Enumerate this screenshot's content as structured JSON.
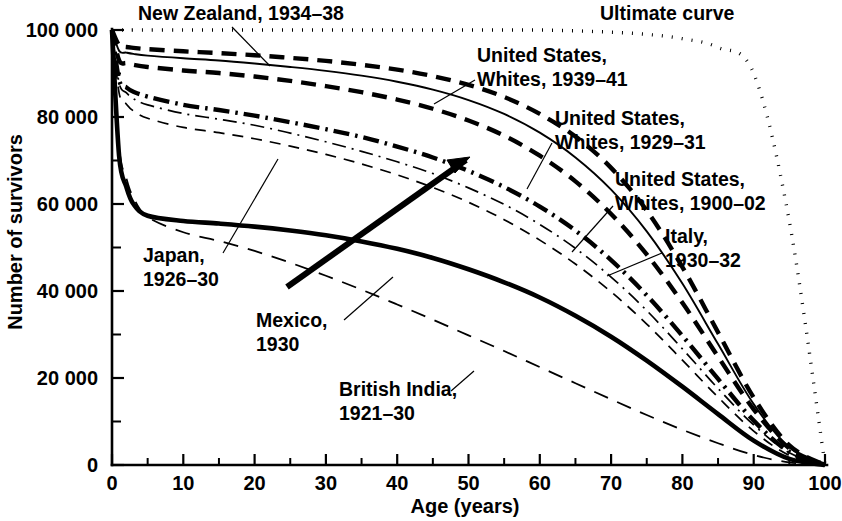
{
  "chart_data": {
    "type": "line",
    "title": "",
    "xlabel": "Age (years)",
    "ylabel": "Number of survivors",
    "xlim": [
      0,
      100
    ],
    "ylim": [
      0,
      100000
    ],
    "grid": false,
    "legend_position": "inline-annotations",
    "x_ticks": [
      0,
      10,
      20,
      30,
      40,
      50,
      60,
      70,
      80,
      90,
      100
    ],
    "x_tick_labels": [
      "0",
      "10",
      "20",
      "30",
      "40",
      "50",
      "60",
      "70",
      "80",
      "90",
      "100"
    ],
    "x_minor_ticks": [
      5,
      15,
      25,
      35,
      45,
      55,
      65,
      75,
      85,
      95
    ],
    "y_ticks": [
      0,
      20000,
      40000,
      60000,
      80000,
      100000
    ],
    "y_tick_labels": [
      "0",
      "20 000",
      "40 000",
      "60 000",
      "80 000",
      "100 000"
    ],
    "y_minor_ticks": [
      10000,
      30000,
      50000,
      70000,
      90000
    ],
    "x": [
      0,
      1,
      2,
      3,
      5,
      10,
      15,
      20,
      25,
      30,
      35,
      40,
      45,
      50,
      55,
      60,
      65,
      70,
      75,
      80,
      85,
      90,
      95,
      100
    ],
    "series": [
      {
        "name": "Ultimate curve",
        "style": "dotted",
        "weight": "medium",
        "values": [
          100000,
          100000,
          100000,
          100000,
          100000,
          100000,
          100000,
          100000,
          100000,
          100000,
          100000,
          100000,
          100000,
          100000,
          100000,
          100000,
          99800,
          99500,
          99000,
          98000,
          96000,
          90000,
          56000,
          0
        ]
      },
      {
        "name": "New Zealand, 1934-38",
        "style": "dashed",
        "weight": "thick",
        "values": [
          100000,
          96500,
          96100,
          95900,
          95600,
          95100,
          94700,
          94200,
          93600,
          92900,
          92000,
          90900,
          89400,
          87400,
          84600,
          80700,
          75500,
          68300,
          58500,
          45500,
          30500,
          15500,
          4500,
          0
        ]
      },
      {
        "name": "United States, Whites, 1939-41",
        "style": "solid",
        "weight": "thin",
        "values": [
          100000,
          95200,
          94800,
          94500,
          94100,
          93500,
          93000,
          92300,
          91500,
          90600,
          89500,
          88100,
          86300,
          83900,
          80700,
          76400,
          70700,
          63300,
          53700,
          41700,
          27800,
          14000,
          4000,
          0
        ]
      },
      {
        "name": "United States, Whites, 1929-31",
        "style": "dashed",
        "weight": "thick",
        "values": [
          100000,
          93000,
          92400,
          92000,
          91500,
          90700,
          90100,
          89300,
          88300,
          87100,
          85700,
          84000,
          81900,
          79200,
          75700,
          71100,
          65200,
          57700,
          48400,
          37300,
          24900,
          12800,
          3800,
          0
        ]
      },
      {
        "name": "United States, Whites, 1900-02",
        "style": "dash-dot",
        "weight": "thin",
        "values": [
          100000,
          87800,
          85600,
          84200,
          82800,
          80800,
          79500,
          78100,
          76300,
          74300,
          72100,
          69700,
          67000,
          63700,
          59900,
          55300,
          49800,
          43200,
          35500,
          26700,
          17600,
          9200,
          2800,
          0
        ]
      },
      {
        "name": "Italy, 1930-32",
        "style": "dash-dot",
        "weight": "thick",
        "values": [
          100000,
          88500,
          86800,
          85800,
          84700,
          82800,
          81600,
          80300,
          78800,
          77200,
          75400,
          73200,
          70700,
          67600,
          63900,
          59400,
          53900,
          47100,
          39000,
          29700,
          19800,
          10200,
          3000,
          0
        ]
      },
      {
        "name": "Japan, 1926-30",
        "style": "dashed",
        "weight": "thin",
        "values": [
          100000,
          85500,
          83000,
          81400,
          79700,
          77600,
          76400,
          75000,
          73300,
          71400,
          69200,
          66700,
          63800,
          60400,
          56400,
          51700,
          46200,
          39800,
          32400,
          24100,
          15600,
          7800,
          2200,
          0
        ]
      },
      {
        "name": "Mexico, 1930",
        "style": "solid",
        "weight": "thick",
        "values": [
          100000,
          71000,
          64000,
          60000,
          57300,
          56100,
          55500,
          54800,
          53900,
          52800,
          51400,
          49700,
          47600,
          45000,
          42000,
          38500,
          34300,
          29500,
          24000,
          18000,
          11700,
          5600,
          1400,
          0
        ]
      },
      {
        "name": "British India, 1921-30",
        "style": "dashed",
        "weight": "thin-long",
        "values": [
          100000,
          73000,
          66000,
          61500,
          57000,
          53500,
          51500,
          49200,
          46500,
          43500,
          40300,
          36900,
          33400,
          29800,
          26200,
          22500,
          18800,
          15100,
          11500,
          8100,
          5000,
          2300,
          600,
          0
        ]
      }
    ],
    "annotations": [
      {
        "id": "new-zealand",
        "text_lines": [
          "New Zealand, 1934–38"
        ],
        "x_px": 138,
        "y_px": 20,
        "anchor": "start"
      },
      {
        "id": "ultimate-curve",
        "text_lines": [
          "Ultimate curve"
        ],
        "x_px": 600,
        "y_px": 20,
        "anchor": "start"
      },
      {
        "id": "united-states-1939",
        "text_lines": [
          "United States,",
          "Whites, 1939–41"
        ],
        "x_px": 477,
        "y_px": 62,
        "anchor": "start"
      },
      {
        "id": "united-states-1929",
        "text_lines": [
          "United States,",
          "Whites, 1929–31"
        ],
        "x_px": 555,
        "y_px": 125,
        "anchor": "start"
      },
      {
        "id": "united-states-1900",
        "text_lines": [
          "United States,",
          "Whites, 1900–02"
        ],
        "x_px": 615,
        "y_px": 186,
        "anchor": "start"
      },
      {
        "id": "italy",
        "text_lines": [
          "Italy,",
          "1930–32"
        ],
        "x_px": 665,
        "y_px": 243,
        "anchor": "start"
      },
      {
        "id": "japan",
        "text_lines": [
          "Japan,",
          "1926–30"
        ],
        "x_px": 143,
        "y_px": 262,
        "anchor": "start"
      },
      {
        "id": "mexico",
        "text_lines": [
          "Mexico,",
          "1930"
        ],
        "x_px": 256,
        "y_px": 327,
        "anchor": "start"
      },
      {
        "id": "british-india",
        "text_lines": [
          "British India,",
          "1921–30"
        ],
        "x_px": 339,
        "y_px": 396,
        "anchor": "start"
      }
    ]
  },
  "colors": {
    "ink": "#000000",
    "background": "#ffffff"
  }
}
